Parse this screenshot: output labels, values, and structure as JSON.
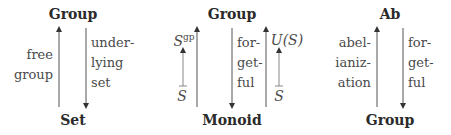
{
  "diagrams": [
    {
      "top": "Group",
      "bottom": "Set",
      "left_label": [
        "free",
        "group"
      ],
      "right_label": [
        "under-",
        "lying",
        "set"
      ]
    },
    {
      "top": "Group",
      "bottom": "Monoid",
      "left_elem_top": "S",
      "left_elem_top_sup": "gp",
      "left_elem_bottom": "S",
      "middle_label": [
        "for-",
        "get-",
        "ful"
      ],
      "right_elem_top": "U(S)",
      "right_elem_bottom": "S"
    },
    {
      "top": "Ab",
      "bottom": "Group",
      "left_label": [
        "abel-",
        "ianiz-",
        "ation"
      ],
      "right_label": [
        "for-",
        "get-",
        "ful"
      ]
    }
  ]
}
